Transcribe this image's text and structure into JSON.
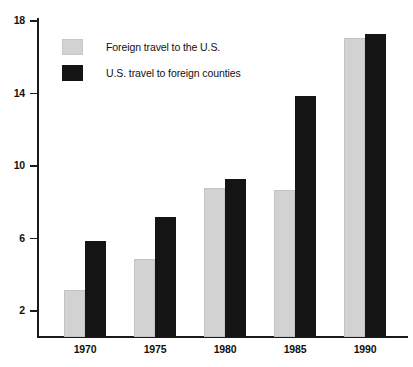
{
  "chart_data": {
    "type": "bar",
    "title": "",
    "subtitle": "",
    "xlabel": "",
    "ylabel": "",
    "categories": [
      "1970",
      "1975",
      "1980",
      "1985",
      "1990"
    ],
    "series": [
      {
        "name": "Foreign travel to the U.S.",
        "color": "#d2d2d2",
        "values": [
          2.6,
          4.3,
          8.2,
          8.1,
          16.5
        ]
      },
      {
        "name": "U.S. travel to foreign counties",
        "color": "#141414",
        "values": [
          5.3,
          6.6,
          8.7,
          13.3,
          16.7
        ]
      }
    ],
    "ylim": [
      0,
      19
    ],
    "yticks": [
      2,
      6,
      10,
      14,
      18
    ],
    "ytick_labels": [
      "2",
      "6",
      "10",
      "14",
      "18"
    ],
    "grid": false,
    "legend_position": "upper-left"
  },
  "legend": {
    "items": [
      {
        "label": "Foreign travel to the U.S.",
        "swatch": "light-gray-swatch"
      },
      {
        "label": "U.S. travel to foreign counties",
        "swatch": "black-swatch"
      }
    ]
  },
  "axes": {
    "y_tick_labels": [
      "18",
      "14",
      "10",
      "6",
      "2"
    ],
    "x_tick_labels": [
      "1970",
      "1975",
      "1980",
      "1985",
      "1990"
    ]
  },
  "colors": {
    "series_light": "#d2d2d2",
    "series_dark": "#141414",
    "axis": "#1a1a1a",
    "background": "#ffffff",
    "text": "#111111"
  }
}
